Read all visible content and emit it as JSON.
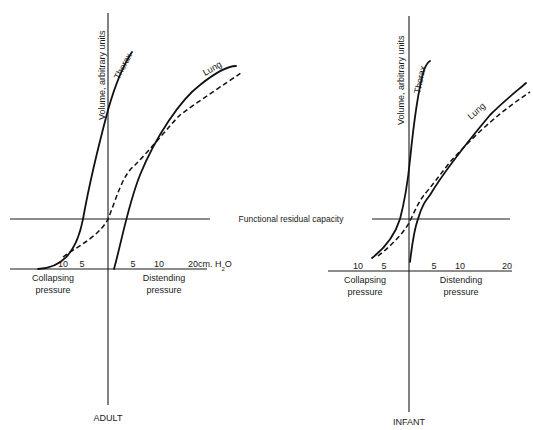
{
  "shared": {
    "frc_label": "Functional residual capacity",
    "y_axis_label": "Volume, arbitrary units",
    "collapsing_line1": "Collapsing",
    "collapsing_line2": "pressure",
    "distending_line1": "Distending",
    "distending_line2": "pressure",
    "thorax_label": "Thorax",
    "lung_label": "Lung",
    "legend": {
      "solid": "Thorax / Lung compliance curves",
      "dashed": "Combined lung + thorax (respiratory system)"
    }
  },
  "adult": {
    "title": "ADULT",
    "ticks_left": [
      "10",
      "5"
    ],
    "ticks_right": [
      "5",
      "10"
    ],
    "tick_units_main": "20cm. H",
    "tick_units_sub": "2",
    "tick_units_tail": "O"
  },
  "infant": {
    "title": "INFANT",
    "ticks_left": [
      "10",
      "5"
    ],
    "ticks_right": [
      "5",
      "10",
      "20"
    ]
  },
  "colors": {
    "ink": "#1a1a1a",
    "background": "#ffffff"
  }
}
